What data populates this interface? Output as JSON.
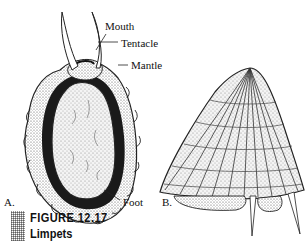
{
  "figure": {
    "number": "FIGURE 12.17",
    "title": "Limpets",
    "accent_swatch_color": "#9a9a9a"
  },
  "panels": [
    {
      "letter": "A.",
      "view": "ventral view of limpet",
      "labels": [
        "Mouth",
        "Tentacle",
        "Mantle",
        "Foot"
      ]
    },
    {
      "letter": "B.",
      "view": "conical limpet shell, side view"
    }
  ]
}
